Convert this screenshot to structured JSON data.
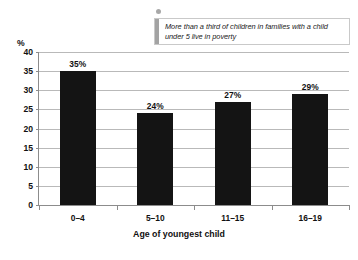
{
  "callout": {
    "text": "More than a third of children in families with a child under 5 live in poverty",
    "dot_icon": "bullet-dot-icon",
    "accent_color": "#a3a3a3",
    "border_color": "#c9c9c9"
  },
  "chart_data": {
    "type": "bar",
    "title": "",
    "subtitle": "",
    "categories": [
      "0–4",
      "5–10",
      "11–15",
      "16–19"
    ],
    "values": [
      35,
      24,
      27,
      29
    ],
    "value_labels": [
      "35%",
      "24%",
      "27%",
      "29%"
    ],
    "xlabel": "Age of youngest child",
    "ylabel": "%",
    "ylim": [
      0,
      40
    ],
    "yticks": [
      0,
      5,
      10,
      15,
      20,
      25,
      30,
      35,
      40
    ],
    "ytick_labels": [
      "0",
      "5",
      "10",
      "15",
      "20",
      "25",
      "30",
      "35",
      "40"
    ],
    "grid": true,
    "legend": false,
    "bar_color": "#141414",
    "gridline_color": "#b9b9b9",
    "axis_color": "#8c8c8c"
  }
}
